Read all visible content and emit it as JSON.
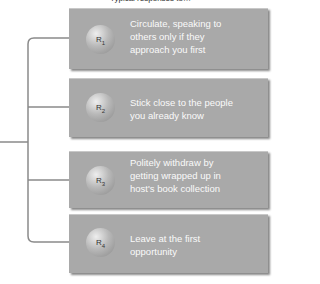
{
  "title": "Typical responses to…",
  "responses": [
    {
      "label": "R",
      "sub": "1",
      "text": "Circulate, speaking to others only if they approach you first"
    },
    {
      "label": "R",
      "sub": "2",
      "text": "Stick close to the people you already know"
    },
    {
      "label": "R",
      "sub": "3",
      "text": "Politely withdraw by getting wrapped up in host's book collection"
    },
    {
      "label": "R",
      "sub": "4",
      "text": "Leave at the first opportunity"
    }
  ],
  "colors": {
    "box": "#a9a9a9",
    "line": "#8a8a8a"
  }
}
